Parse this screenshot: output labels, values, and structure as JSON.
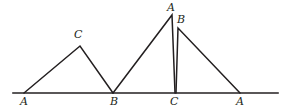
{
  "figure": {
    "name": "three-triangles-on-common-baseline",
    "width": 287,
    "height": 111,
    "background_color": "#ffffff",
    "stroke_color": "#231f20",
    "baseline": {
      "name": "horizontal-baseline",
      "x1": 13,
      "y1": 93,
      "x2": 278,
      "y2": 93,
      "stroke_width": 1.6
    },
    "triangles": [
      {
        "name": "left-triangle",
        "points": "24,93 80,46 113,93",
        "stroke_width": 1.5
      },
      {
        "name": "middle-triangle",
        "points": "113,93 172,15 175,93",
        "stroke_width": 1.5
      },
      {
        "name": "right-triangle",
        "points": "176,93 178,28 240,93",
        "stroke_width": 1.5
      }
    ],
    "labels": [
      {
        "name": "label-apex-c-left",
        "text": "C",
        "x": 74,
        "y": 29
      },
      {
        "name": "label-apex-a-middle",
        "text": "A",
        "x": 167,
        "y": 2
      },
      {
        "name": "label-apex-b-right",
        "text": "B",
        "x": 177,
        "y": 14
      },
      {
        "name": "label-base-a-left",
        "text": "A",
        "x": 20,
        "y": 96
      },
      {
        "name": "label-base-b",
        "text": "B",
        "x": 110,
        "y": 96
      },
      {
        "name": "label-base-c",
        "text": "C",
        "x": 170,
        "y": 96
      },
      {
        "name": "label-base-a-right",
        "text": "A",
        "x": 236,
        "y": 96
      }
    ]
  }
}
